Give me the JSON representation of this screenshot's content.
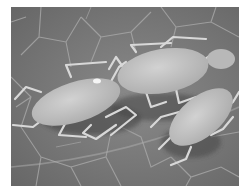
{
  "image": {
    "subject": "Aphids on a leaf",
    "style": "grayscale photograph",
    "colors": {
      "background": "#ffffff",
      "leaf": "#7d7d7d",
      "leaf_veins": "#a8a8a8",
      "aphid_body": "#c4c4c4",
      "aphid_legs": "#d6d6d6",
      "shadow": "#4a4a4a"
    },
    "aphid_count": 3
  }
}
